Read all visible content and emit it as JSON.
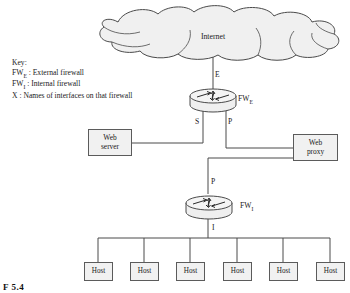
{
  "figure": {
    "caption": "F 5.4",
    "background": "#ffffff",
    "line_color": "#4a4a4a",
    "box_fill": "#f1f1f1",
    "box_stroke": "#5b5b5b"
  },
  "key": {
    "title": "Key:",
    "entries": [
      {
        "term": "FW",
        "sub": "E",
        "sep": " : ",
        "desc": "External firewall"
      },
      {
        "term": "FW",
        "sub": "I",
        "sep": " : ",
        "desc": "Internal firewall"
      },
      {
        "term": "X",
        "sub": "",
        "sep": " : ",
        "desc": "Names of interfaces on that firewall"
      }
    ],
    "line1": "Key:",
    "line2_desc": "External firewall",
    "line3_desc": "Internal firewall",
    "line4_term": "X",
    "line4_desc": "Names of interfaces on that firewall",
    "fw_term": "FW"
  },
  "cloud": {
    "label": "Internet"
  },
  "firewalls": [
    {
      "id": "external",
      "name": "FW",
      "sub": "E",
      "interfaces": [
        "E",
        "S",
        "P"
      ]
    },
    {
      "id": "internal",
      "name": "FW",
      "sub": "I",
      "interfaces": [
        "P",
        "I"
      ]
    }
  ],
  "interface_labels": {
    "external_top": "E",
    "external_left": "S",
    "external_right": "P",
    "internal_top": "P",
    "internal_bottom": "I"
  },
  "fw_external": {
    "name": "FW",
    "sub": "E"
  },
  "fw_internal": {
    "name": "FW",
    "sub": "I"
  },
  "servers": {
    "web_server": {
      "line1": "Web",
      "line2": "server"
    },
    "web_proxy": {
      "line1": "Web",
      "line2": "proxy"
    }
  },
  "hosts": [
    {
      "label": "Host"
    },
    {
      "label": "Host"
    },
    {
      "label": "Host"
    },
    {
      "label": "Host"
    },
    {
      "label": "Host"
    },
    {
      "label": "Host"
    }
  ]
}
